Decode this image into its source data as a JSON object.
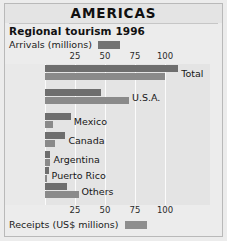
{
  "header": {
    "title": "AMERICAS",
    "subtitle": "Regional tourism 1996"
  },
  "legend": {
    "arrivals_label": "Arrivals (millions)",
    "receipts_label": "Receipts (US$ millions)",
    "arrivals_swatch": "legend-swatch-arrivals",
    "receipts_swatch": "legend-swatch-receipts"
  },
  "colors": {
    "arrivals": "#6e6e6e",
    "receipts": "#8a8a8a",
    "panel": "#e4e4e4",
    "page": "#ececec",
    "grid": "#fbfbfb"
  },
  "chart_data": {
    "type": "bar",
    "orientation": "horizontal",
    "title": "Regional tourism 1996",
    "subtitle": "AMERICAS",
    "xlabel": "",
    "ylabel": "",
    "xlim": [
      0,
      118
    ],
    "ticks": [
      25,
      50,
      75,
      100
    ],
    "tick_labels": [
      "25",
      "50",
      "75",
      "100"
    ],
    "grid": true,
    "axis_positions": "top and bottom",
    "legend_position": "top-left and bottom-left",
    "categories": [
      "Total",
      "U.S.A.",
      "Mexico",
      "Canada",
      "Argentina",
      "Puerto Rico",
      "Others"
    ],
    "series": [
      {
        "name": "Arrivals (millions)",
        "color": "#6e6e6e",
        "values": [
          111,
          47,
          21.5,
          17,
          4.5,
          3,
          18
        ]
      },
      {
        "name": "Receipts (US$ millions)",
        "color": "#8a8a8a",
        "values": [
          100,
          70,
          7,
          8,
          4.5,
          2,
          28
        ]
      }
    ]
  }
}
